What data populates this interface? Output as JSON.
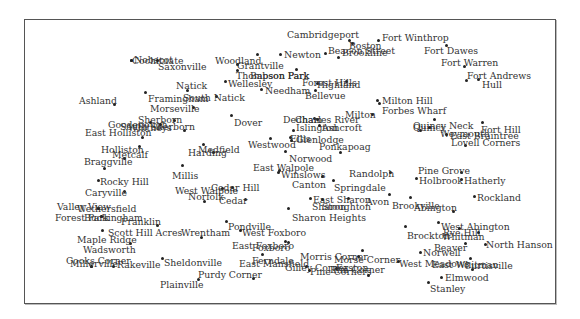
{
  "map": {
    "type": "labeled point map (towns)",
    "frame": {
      "x": 24,
      "y": 19,
      "width": 530,
      "height": 283
    },
    "places": [
      {
        "name": "Cambridgeport",
        "lx": 287,
        "ly": 30,
        "dx": 349,
        "dy": 40
      },
      {
        "name": "Boston",
        "lx": 349,
        "ly": 41,
        "dx": 352,
        "dy": 43
      },
      {
        "name": "Beacon Street",
        "lx": 328,
        "ly": 46,
        "dx": 325,
        "dy": 53
      },
      {
        "name": "Brookline",
        "lx": 342,
        "ly": 48,
        "dx": 338,
        "dy": 57
      },
      {
        "name": "Fort Winthrop",
        "lx": 382,
        "ly": 33,
        "dx": 378,
        "dy": 40
      },
      {
        "name": "Fort Dawes",
        "lx": 424,
        "ly": 46,
        "dx": 446,
        "dy": 45
      },
      {
        "name": "Fort Warren",
        "lx": 441,
        "ly": 58,
        "dx": 464,
        "dy": 66
      },
      {
        "name": "Fort Andrews",
        "lx": 467,
        "ly": 71,
        "dx": 466,
        "dy": 80
      },
      {
        "name": "Hull",
        "lx": 482,
        "ly": 80,
        "dx": 478,
        "dy": 79
      },
      {
        "name": "Cochituate",
        "lx": 132,
        "ly": 56,
        "dx": 131,
        "dy": 60
      },
      {
        "name": "Nobscot",
        "lx": 134,
        "ly": 55,
        "dx": 131,
        "dy": 60
      },
      {
        "name": "Saxonville",
        "lx": 158,
        "ly": 62,
        "dx": 157,
        "dy": 60
      },
      {
        "name": "Woodland",
        "lx": 215,
        "ly": 56,
        "dx": 257,
        "dy": 54
      },
      {
        "name": "Grantville",
        "lx": 237,
        "ly": 61,
        "dx": 237,
        "dy": 64
      },
      {
        "name": "Newton",
        "lx": 284,
        "ly": 50,
        "dx": 280,
        "dy": 54
      },
      {
        "name": "Thompson Park",
        "lx": 236,
        "ly": 71,
        "dx": 237,
        "dy": 70
      },
      {
        "name": "Babson Park",
        "lx": 250,
        "ly": 71,
        "dx": 296,
        "dy": 69
      },
      {
        "name": "Wellesley",
        "lx": 228,
        "ly": 79,
        "dx": 225,
        "dy": 81
      },
      {
        "name": "Needham",
        "lx": 265,
        "ly": 86,
        "dx": 261,
        "dy": 89
      },
      {
        "name": "Forest Hills",
        "lx": 302,
        "ly": 78,
        "dx": 346,
        "dy": 81
      },
      {
        "name": "Highland",
        "lx": 317,
        "ly": 80,
        "dx": 317,
        "dy": 83
      },
      {
        "name": "Bellevue",
        "lx": 305,
        "ly": 91,
        "dx": 315,
        "dy": 90
      },
      {
        "name": "Natick",
        "lx": 176,
        "ly": 81,
        "dx": 187,
        "dy": 90
      },
      {
        "name": "South Natick",
        "lx": 183,
        "ly": 93,
        "dx": 216,
        "dy": 96
      },
      {
        "name": "Framingham",
        "lx": 148,
        "ly": 94,
        "dx": 145,
        "dy": 92
      },
      {
        "name": "Ashland",
        "lx": 79,
        "ly": 96,
        "dx": 114,
        "dy": 104
      },
      {
        "name": "Morseville",
        "lx": 150,
        "ly": 104,
        "dx": 193,
        "dy": 107
      },
      {
        "name": "Sherborn",
        "lx": 138,
        "ly": 115,
        "dx": 174,
        "dy": 120
      },
      {
        "name": "Goodenough",
        "lx": 108,
        "ly": 120,
        "dx": 150,
        "dy": 122
      },
      {
        "name": "South Sherborn",
        "lx": 120,
        "ly": 122,
        "dx": 184,
        "dy": 130
      },
      {
        "name": "Whitneys",
        "lx": 128,
        "ly": 123,
        "dx": 160,
        "dy": 124
      },
      {
        "name": "East Holliston",
        "lx": 85,
        "ly": 128,
        "dx": 142,
        "dy": 137
      },
      {
        "name": "Dover",
        "lx": 234,
        "ly": 118,
        "dx": 231,
        "dy": 115
      },
      {
        "name": "Milton Hill",
        "lx": 382,
        "ly": 96,
        "dx": 377,
        "dy": 100
      },
      {
        "name": "Forbes Wharf",
        "lx": 382,
        "ly": 106,
        "dx": 379,
        "dy": 103
      },
      {
        "name": "Milton",
        "lx": 345,
        "ly": 110,
        "dx": 372,
        "dy": 114
      },
      {
        "name": "Dedham",
        "lx": 283,
        "ly": 115,
        "dx": 314,
        "dy": 118
      },
      {
        "name": "Charles River",
        "lx": 295,
        "ly": 115,
        "dx": 317,
        "dy": 119
      },
      {
        "name": "Islington",
        "lx": 296,
        "ly": 123,
        "dx": 293,
        "dy": 130
      },
      {
        "name": "Ashcroft",
        "lx": 322,
        "ly": 123,
        "dx": 319,
        "dy": 125
      },
      {
        "name": "Quincy Neck",
        "lx": 413,
        "ly": 121,
        "dx": 434,
        "dy": 119
      },
      {
        "name": "Quincy",
        "lx": 413,
        "ly": 123,
        "dx": 420,
        "dy": 130
      },
      {
        "name": "Weymouth",
        "lx": 440,
        "ly": 129,
        "dx": 429,
        "dy": 127
      },
      {
        "name": "East Braintree",
        "lx": 450,
        "ly": 131,
        "dx": 446,
        "dy": 134
      },
      {
        "name": "Lovell Corners",
        "lx": 451,
        "ly": 138,
        "dx": 465,
        "dy": 145
      },
      {
        "name": "Fort Hill",
        "lx": 481,
        "ly": 125,
        "dx": 482,
        "dy": 122
      },
      {
        "name": "Westwood",
        "lx": 248,
        "ly": 140,
        "dx": 270,
        "dy": 138
      },
      {
        "name": "Ellis",
        "lx": 290,
        "ly": 134,
        "dx": 290,
        "dy": 137
      },
      {
        "name": "Glenlodge",
        "lx": 296,
        "ly": 135,
        "dx": 291,
        "dy": 140
      },
      {
        "name": "Ponkapoag",
        "lx": 319,
        "ly": 142,
        "dx": 340,
        "dy": 152
      },
      {
        "name": "Medfield",
        "lx": 198,
        "ly": 145,
        "dx": 203,
        "dy": 144
      },
      {
        "name": "Harding",
        "lx": 188,
        "ly": 148,
        "dx": 213,
        "dy": 152
      },
      {
        "name": "Holliston",
        "lx": 101,
        "ly": 145,
        "dx": 139,
        "dy": 146
      },
      {
        "name": "Metcalf",
        "lx": 112,
        "ly": 150,
        "dx": 124,
        "dy": 158
      },
      {
        "name": "Norwood",
        "lx": 289,
        "ly": 154,
        "dx": 285,
        "dy": 151
      },
      {
        "name": "Braggville",
        "lx": 84,
        "ly": 157,
        "dx": 104,
        "dy": 168
      },
      {
        "name": "East Walpole",
        "lx": 253,
        "ly": 163,
        "dx": 279,
        "dy": 170
      },
      {
        "name": "Winslows",
        "lx": 281,
        "ly": 170,
        "dx": 278,
        "dy": 172
      },
      {
        "name": "Canton",
        "lx": 292,
        "ly": 180,
        "dx": 322,
        "dy": 176
      },
      {
        "name": "Springdale",
        "lx": 334,
        "ly": 183,
        "dx": 333,
        "dy": 180
      },
      {
        "name": "Randolph",
        "lx": 349,
        "ly": 169,
        "dx": 390,
        "dy": 172
      },
      {
        "name": "Pine Grove",
        "lx": 418,
        "ly": 166,
        "dx": 461,
        "dy": 172
      },
      {
        "name": "Holbrook",
        "lx": 419,
        "ly": 176,
        "dx": 416,
        "dy": 178
      },
      {
        "name": "Hatherly",
        "lx": 464,
        "ly": 176,
        "dx": 461,
        "dy": 179
      },
      {
        "name": "Rockland",
        "lx": 477,
        "ly": 193,
        "dx": 474,
        "dy": 196
      },
      {
        "name": "Millis",
        "lx": 172,
        "ly": 171,
        "dx": 182,
        "dy": 165
      },
      {
        "name": "Rocky Hill",
        "lx": 100,
        "ly": 177,
        "dx": 98,
        "dy": 180
      },
      {
        "name": "Cedar Hill",
        "lx": 211,
        "ly": 183,
        "dx": 232,
        "dy": 187
      },
      {
        "name": "West Walpole",
        "lx": 175,
        "ly": 186,
        "dx": 222,
        "dy": 188
      },
      {
        "name": "Norfolk",
        "lx": 188,
        "ly": 192,
        "dx": 204,
        "dy": 201
      },
      {
        "name": "Cedar",
        "lx": 219,
        "ly": 196,
        "dx": 245,
        "dy": 199
      },
      {
        "name": "Caryville",
        "lx": 85,
        "ly": 188,
        "dx": 124,
        "dy": 191
      },
      {
        "name": "East Sharon",
        "lx": 313,
        "ly": 195,
        "dx": 348,
        "dy": 198
      },
      {
        "name": "Sharon",
        "lx": 312,
        "ly": 202,
        "dx": 310,
        "dy": 198
      },
      {
        "name": "Stoughton",
        "lx": 322,
        "ly": 202,
        "dx": 322,
        "dy": 199
      },
      {
        "name": "Avon",
        "lx": 366,
        "ly": 197,
        "dx": 389,
        "dy": 194
      },
      {
        "name": "Brookville",
        "lx": 392,
        "ly": 201,
        "dx": 410,
        "dy": 197
      },
      {
        "name": "Abington",
        "lx": 414,
        "ly": 203,
        "dx": 453,
        "dy": 211
      },
      {
        "name": "Valley View",
        "lx": 57,
        "ly": 202,
        "dx": 98,
        "dy": 208
      },
      {
        "name": "Wethersfield",
        "lx": 77,
        "ly": 204,
        "dx": 98,
        "dy": 208
      },
      {
        "name": "Sharon Heights",
        "lx": 292,
        "ly": 213,
        "dx": 288,
        "dy": 208
      },
      {
        "name": "Forest Park",
        "lx": 55,
        "ly": 213,
        "dx": 101,
        "dy": 216
      },
      {
        "name": "Buckingham",
        "lx": 84,
        "ly": 213,
        "dx": 101,
        "dy": 216
      },
      {
        "name": "Franklin",
        "lx": 121,
        "ly": 217,
        "dx": 157,
        "dy": 225
      },
      {
        "name": "West Abington",
        "lx": 441,
        "ly": 222,
        "dx": 438,
        "dy": 222
      },
      {
        "name": "Scott Hill Acres",
        "lx": 108,
        "ly": 228,
        "dx": 102,
        "dy": 230
      },
      {
        "name": "Wrentham",
        "lx": 181,
        "ly": 228,
        "dx": 201,
        "dy": 237
      },
      {
        "name": "Pondville",
        "lx": 228,
        "ly": 222,
        "dx": 226,
        "dy": 221
      },
      {
        "name": "West Foxboro",
        "lx": 242,
        "ly": 228,
        "dx": 240,
        "dy": 230
      },
      {
        "name": "Brockton",
        "lx": 407,
        "ly": 231,
        "dx": 405,
        "dy": 226
      },
      {
        "name": "Rye Hill",
        "lx": 443,
        "ly": 228,
        "dx": 459,
        "dy": 228
      },
      {
        "name": "Whitman",
        "lx": 442,
        "ly": 232,
        "dx": 478,
        "dy": 232
      },
      {
        "name": "Maple Ridge",
        "lx": 77,
        "ly": 235,
        "dx": 130,
        "dy": 243
      },
      {
        "name": "North Hanson",
        "lx": 486,
        "ly": 240,
        "dx": 485,
        "dy": 244
      },
      {
        "name": "East Foxboro",
        "lx": 232,
        "ly": 241,
        "dx": 288,
        "dy": 242
      },
      {
        "name": "Foxboro",
        "lx": 252,
        "ly": 243,
        "dx": 285,
        "dy": 241
      },
      {
        "name": "Beaver",
        "lx": 434,
        "ly": 243,
        "dx": 465,
        "dy": 243
      },
      {
        "name": "Norwell",
        "lx": 423,
        "ly": 248,
        "dx": 420,
        "dy": 252
      },
      {
        "name": "Wadsworth",
        "lx": 83,
        "ly": 245,
        "dx": 0,
        "dy": 0
      },
      {
        "name": "Morris Corner",
        "lx": 300,
        "ly": 252,
        "dx": 362,
        "dy": 250
      },
      {
        "name": "Morse Corner",
        "lx": 334,
        "ly": 255,
        "dx": 358,
        "dy": 256
      },
      {
        "name": "Ferndale",
        "lx": 252,
        "ly": 256,
        "dx": 262,
        "dy": 254
      },
      {
        "name": "East Mansfield",
        "lx": 239,
        "ly": 259,
        "dx": 0,
        "dy": 0
      },
      {
        "name": "Gilley Corner",
        "lx": 285,
        "ly": 263,
        "dx": 306,
        "dy": 266
      },
      {
        "name": "Easton",
        "lx": 336,
        "ly": 263,
        "dx": 336,
        "dy": 268
      },
      {
        "name": "Pine Corners",
        "lx": 310,
        "ly": 267,
        "dx": 309,
        "dy": 270
      },
      {
        "name": "Elm Corner",
        "lx": 330,
        "ly": 265,
        "dx": 368,
        "dy": 275
      },
      {
        "name": "West Meadows",
        "lx": 399,
        "ly": 259,
        "dx": 398,
        "dy": 261
      },
      {
        "name": "East Whitman",
        "lx": 432,
        "ly": 260,
        "dx": 470,
        "dy": 258
      },
      {
        "name": "Curtisville",
        "lx": 464,
        "ly": 261,
        "dx": 472,
        "dy": 269
      },
      {
        "name": "Elmwood",
        "lx": 445,
        "ly": 273,
        "dx": 441,
        "dy": 277
      },
      {
        "name": "Stanley",
        "lx": 430,
        "ly": 284,
        "dx": 428,
        "dy": 282
      },
      {
        "name": "Cooks Corner",
        "lx": 66,
        "ly": 256,
        "dx": 91,
        "dy": 266
      },
      {
        "name": "Millerville",
        "lx": 70,
        "ly": 259,
        "dx": 91,
        "dy": 266
      },
      {
        "name": "Rakeville",
        "lx": 117,
        "ly": 260,
        "dx": 113,
        "dy": 266
      },
      {
        "name": "Sheldonville",
        "lx": 164,
        "ly": 258,
        "dx": 162,
        "dy": 258
      },
      {
        "name": "Purdy Corner",
        "lx": 198,
        "ly": 270,
        "dx": 253,
        "dy": 278
      },
      {
        "name": "Plainville",
        "lx": 160,
        "ly": 280,
        "dx": 198,
        "dy": 279
      }
    ]
  }
}
